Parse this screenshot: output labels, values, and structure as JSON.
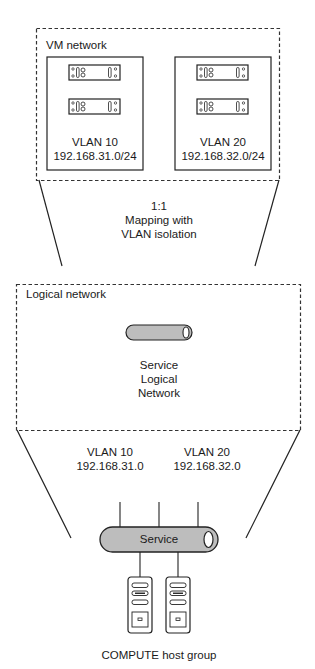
{
  "vm_network": {
    "title": "VM network",
    "vlans": [
      {
        "name": "VLAN 10",
        "subnet": "192.168.31.0/24"
      },
      {
        "name": "VLAN 20",
        "subnet": "192.168.32.0/24"
      }
    ]
  },
  "mapping": {
    "ratio": "1:1",
    "line1": "Mapping with",
    "line2": "VLAN isolation"
  },
  "logical_network": {
    "title": "Logical network",
    "service_line1": "Service",
    "service_line2": "Logical",
    "service_line3": "Network"
  },
  "host_side": {
    "vlans": [
      {
        "name": "VLAN 10",
        "subnet": "192.168.31.0"
      },
      {
        "name": "VLAN 20",
        "subnet": "192.168.32.0"
      }
    ],
    "switch_label": "Service",
    "group_label": "COMPUTE host group"
  },
  "colors": {
    "line": "#222222",
    "pipe_fill": "#bdbdbd",
    "dash": "#333333"
  }
}
